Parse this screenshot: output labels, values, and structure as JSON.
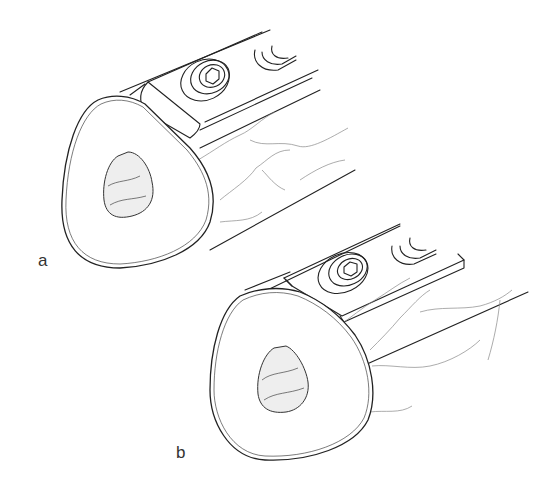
{
  "figure": {
    "panels": [
      {
        "label": "a"
      },
      {
        "label": "b"
      }
    ],
    "colors": {
      "ink": "#222222",
      "background": "#ffffff",
      "crack": "#888888"
    }
  }
}
